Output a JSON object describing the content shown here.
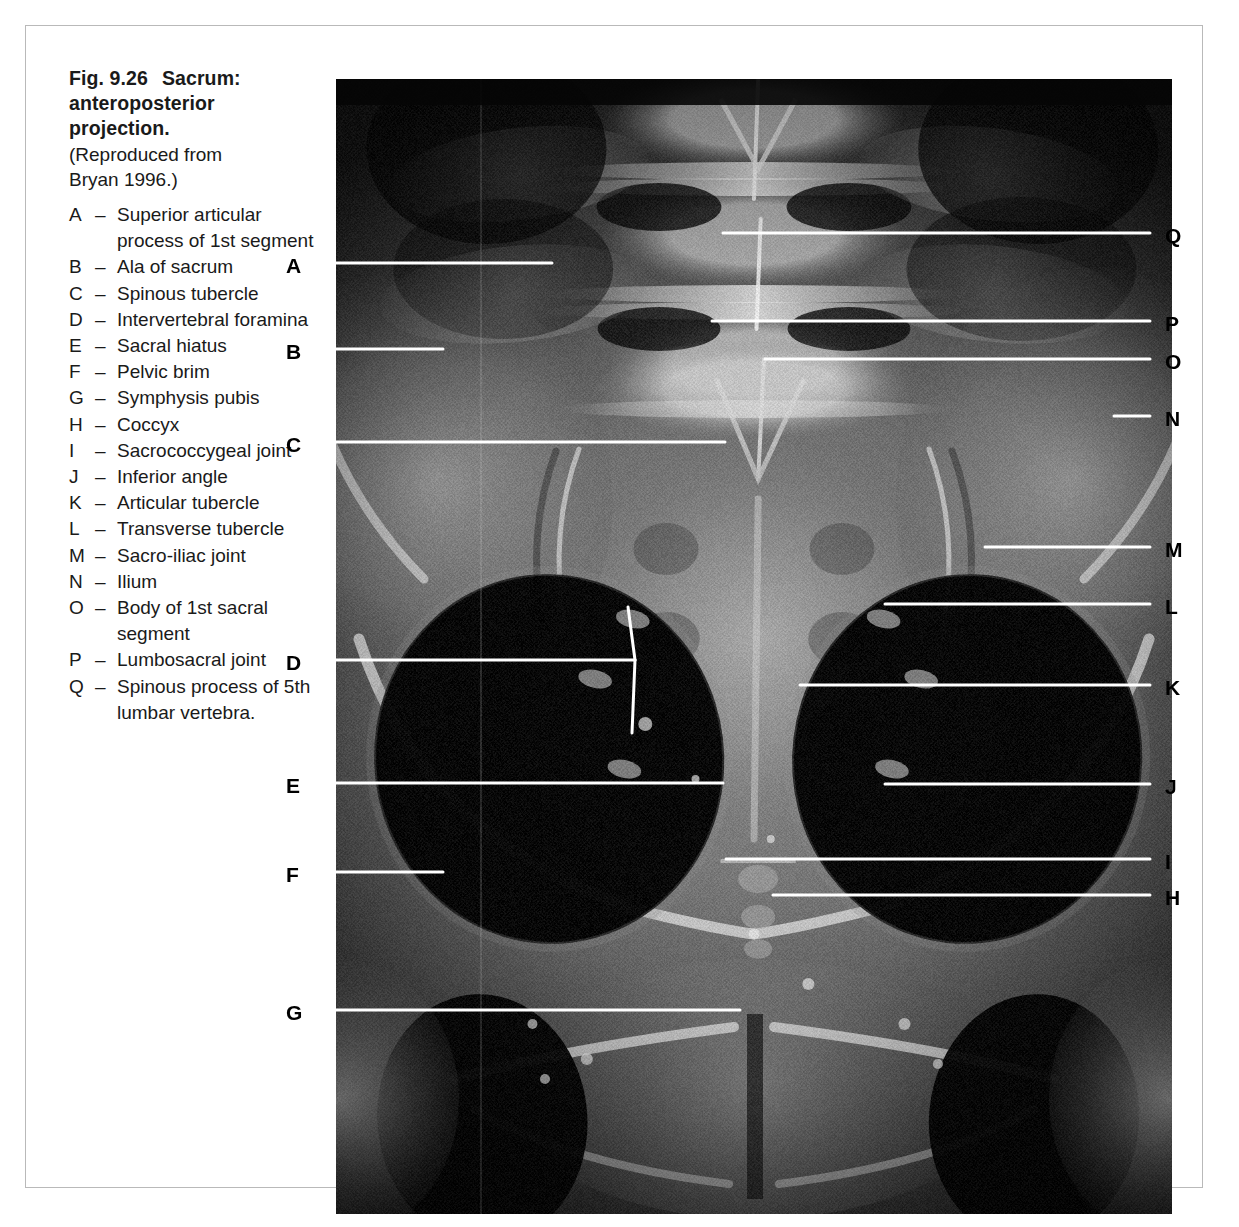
{
  "figure": {
    "number": "Fig. 9.26",
    "title": "Sacrum:",
    "title_line2": "anteroposterior",
    "title_line3": "projection.",
    "source_line1": "(Reproduced from",
    "source_line2": "Bryan 1996.)"
  },
  "legend": [
    {
      "key": "A",
      "dash": "–",
      "text": "Superior articular process of 1st segment"
    },
    {
      "key": "B",
      "dash": "–",
      "text": "Ala of sacrum"
    },
    {
      "key": "C",
      "dash": "–",
      "text": "Spinous tubercle"
    },
    {
      "key": "D",
      "dash": "–",
      "text": "Intervertebral foramina"
    },
    {
      "key": "E",
      "dash": "–",
      "text": "Sacral hiatus"
    },
    {
      "key": "F",
      "dash": "–",
      "text": "Pelvic brim"
    },
    {
      "key": "G",
      "dash": "–",
      "text": "Symphysis pubis"
    },
    {
      "key": "H",
      "dash": "–",
      "text": "Coccyx"
    },
    {
      "key": "I",
      "dash": "–",
      "text": "Sacrococcygeal joint"
    },
    {
      "key": "J",
      "dash": "–",
      "text": "Inferior angle"
    },
    {
      "key": "K",
      "dash": "–",
      "text": "Articular tubercle"
    },
    {
      "key": "L",
      "dash": "–",
      "text": "Transverse tubercle"
    },
    {
      "key": "M",
      "dash": "–",
      "text": "Sacro-iliac joint"
    },
    {
      "key": "N",
      "dash": "–",
      "text": "Ilium"
    },
    {
      "key": "O",
      "dash": "–",
      "text": "Body of 1st sacral segment"
    },
    {
      "key": "P",
      "dash": "–",
      "text": "Lumbosacral joint"
    },
    {
      "key": "Q",
      "dash": "–",
      "text": "Spinous process of 5th lumbar vertebra."
    }
  ],
  "markers": {
    "left": [
      {
        "key": "A",
        "y": 255
      },
      {
        "key": "B",
        "y": 341
      },
      {
        "key": "C",
        "y": 434
      },
      {
        "key": "D",
        "y": 652
      },
      {
        "key": "E",
        "y": 775
      },
      {
        "key": "F",
        "y": 864
      },
      {
        "key": "G",
        "y": 1002
      }
    ],
    "right": [
      {
        "key": "Q",
        "y": 225
      },
      {
        "key": "P",
        "y": 313
      },
      {
        "key": "O",
        "y": 351
      },
      {
        "key": "N",
        "y": 408
      },
      {
        "key": "M",
        "y": 539
      },
      {
        "key": "L",
        "y": 596
      },
      {
        "key": "K",
        "y": 677
      },
      {
        "key": "J",
        "y": 776
      },
      {
        "key": "I",
        "y": 851
      },
      {
        "key": "H",
        "y": 887
      }
    ]
  },
  "leader_lines": [
    {
      "key": "A",
      "x1": 308,
      "y1": 263,
      "x2": 552,
      "y2": 263
    },
    {
      "key": "B",
      "x1": 308,
      "y1": 349,
      "x2": 443,
      "y2": 349
    },
    {
      "key": "C",
      "x1": 308,
      "y1": 442,
      "x2": 725,
      "y2": 442
    },
    {
      "key": "D",
      "x1": 308,
      "y1": 660,
      "x2": 635,
      "y2": 660
    },
    {
      "key": "D-branch-up",
      "x1": 635,
      "y1": 660,
      "x2": 628,
      "y2": 607
    },
    {
      "key": "D-branch-down",
      "x1": 635,
      "y1": 660,
      "x2": 632,
      "y2": 733
    },
    {
      "key": "E",
      "x1": 308,
      "y1": 783,
      "x2": 723,
      "y2": 783
    },
    {
      "key": "F",
      "x1": 308,
      "y1": 872,
      "x2": 443,
      "y2": 872
    },
    {
      "key": "G",
      "x1": 308,
      "y1": 1010,
      "x2": 740,
      "y2": 1010
    },
    {
      "key": "Q",
      "x1": 723,
      "y1": 233,
      "x2": 1150,
      "y2": 233
    },
    {
      "key": "P",
      "x1": 712,
      "y1": 321,
      "x2": 1150,
      "y2": 321
    },
    {
      "key": "O",
      "x1": 765,
      "y1": 359,
      "x2": 1150,
      "y2": 359
    },
    {
      "key": "N",
      "x1": 1114,
      "y1": 416,
      "x2": 1150,
      "y2": 416
    },
    {
      "key": "M",
      "x1": 985,
      "y1": 547,
      "x2": 1150,
      "y2": 547
    },
    {
      "key": "L",
      "x1": 885,
      "y1": 604,
      "x2": 1150,
      "y2": 604
    },
    {
      "key": "K",
      "x1": 800,
      "y1": 685,
      "x2": 1150,
      "y2": 685
    },
    {
      "key": "J",
      "x1": 885,
      "y1": 784,
      "x2": 1150,
      "y2": 784
    },
    {
      "key": "I",
      "x1": 726,
      "y1": 859,
      "x2": 1150,
      "y2": 859
    },
    {
      "key": "H",
      "x1": 773,
      "y1": 895,
      "x2": 1150,
      "y2": 895
    }
  ],
  "colors": {
    "leader_line": "#ffffff",
    "text": "#1a1a1a",
    "frame_border": "#b9b9b9",
    "background": "#ffffff"
  },
  "radiograph": {
    "modality": "X-ray",
    "region": "Sacrum and pelvis",
    "projection": "anteroposterior"
  }
}
